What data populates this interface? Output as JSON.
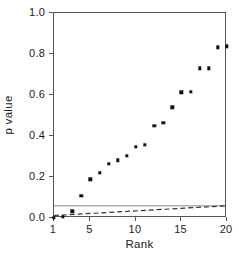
{
  "chart_data": {
    "type": "scatter",
    "title": "",
    "xlabel": "Rank",
    "ylabel": "p value",
    "xlim": [
      1,
      20
    ],
    "ylim": [
      0.0,
      1.0
    ],
    "grid": false,
    "legend": "none",
    "x": [
      1,
      2,
      3,
      4,
      5,
      6,
      7,
      8,
      9,
      10,
      11,
      12,
      13,
      14,
      15,
      16,
      17,
      18,
      19,
      20
    ],
    "values": [
      0.002,
      0.005,
      0.032,
      0.108,
      0.188,
      0.219,
      0.263,
      0.281,
      0.302,
      0.348,
      0.358,
      0.449,
      0.464,
      0.54,
      0.613,
      0.616,
      0.731,
      0.731,
      0.833,
      0.838
    ],
    "series": [
      {
        "name": "observed p values",
        "marker": "square",
        "color": "#111111",
        "values": [
          0.002,
          0.005,
          0.032,
          0.108,
          0.188,
          0.219,
          0.263,
          0.281,
          0.302,
          0.348,
          0.358,
          0.449,
          0.464,
          0.54,
          0.613,
          0.616,
          0.731,
          0.731,
          0.833,
          0.838
        ]
      }
    ],
    "reference_lines": [
      {
        "name": "alpha threshold",
        "style": "solid",
        "color": "#888888",
        "orientation": "horizontal",
        "y": 0.05
      },
      {
        "name": "benjamini-hochberg critical line",
        "style": "dashed",
        "color": "#333333",
        "orientation": "sloped",
        "x_start": 1,
        "y_start": 0.0025,
        "x_end": 20,
        "y_end": 0.05
      }
    ],
    "xticks": [
      1,
      5,
      10,
      15,
      20
    ],
    "xtick_labels": [
      "1",
      "5",
      "10",
      "15",
      "20"
    ],
    "yticks": [
      0.0,
      0.2,
      0.4,
      0.6,
      0.8,
      1.0
    ],
    "ytick_labels": [
      "0.0",
      "0.2",
      "0.4",
      "0.6",
      "0.8",
      "1.0"
    ]
  }
}
